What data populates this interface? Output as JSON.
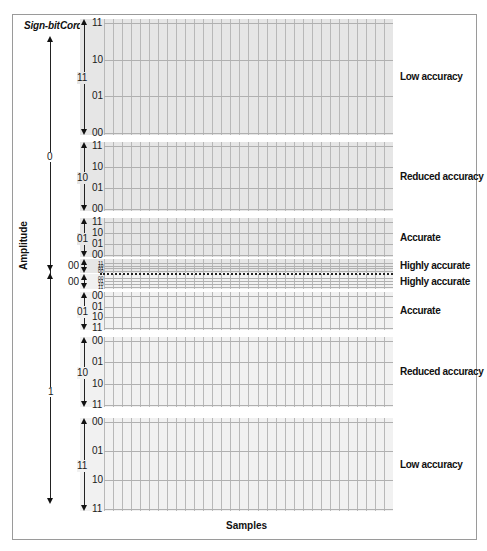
{
  "headers": {
    "sign_bit": "Sign-bit",
    "chord_bit": "Cord-bit",
    "step_bit": "Step-bit"
  },
  "axis": {
    "y_label": "Amplitude",
    "x_label": "Samples"
  },
  "sign_values": {
    "top": "0",
    "bottom": "1"
  },
  "sections": [
    {
      "chord": "11",
      "accuracy": "Low accuracy",
      "steps": [
        "11",
        "10",
        "01",
        "00"
      ],
      "top": 19,
      "bottom": 135,
      "shade": "dark"
    },
    {
      "chord": "10",
      "accuracy": "Reduced accuracy",
      "steps": [
        "11",
        "10",
        "01",
        "00"
      ],
      "top": 142,
      "bottom": 211,
      "shade": "dark"
    },
    {
      "chord": "01",
      "accuracy": "Accurate",
      "steps": [
        "11",
        "10",
        "01",
        "00"
      ],
      "top": 218,
      "bottom": 257,
      "shade": "dark"
    },
    {
      "chord": "00",
      "accuracy": "Highly accurate",
      "steps": [
        "11",
        "10",
        "01",
        "00"
      ],
      "top": 259,
      "bottom": 273,
      "shade": "dark"
    },
    {
      "chord": "00",
      "accuracy": "Highly accurate",
      "steps": [
        "00",
        "01",
        "10",
        "11"
      ],
      "top": 274,
      "bottom": 289,
      "shade": "light"
    },
    {
      "chord": "01",
      "accuracy": "Accurate",
      "steps": [
        "00",
        "01",
        "10",
        "11"
      ],
      "top": 292,
      "bottom": 330,
      "shade": "light"
    },
    {
      "chord": "10",
      "accuracy": "Reduced accuracy",
      "steps": [
        "00",
        "01",
        "10",
        "11"
      ],
      "top": 337,
      "bottom": 407,
      "shade": "light"
    },
    {
      "chord": "11",
      "accuracy": "Low accuracy",
      "steps": [
        "00",
        "01",
        "10",
        "11"
      ],
      "top": 418,
      "bottom": 511,
      "shade": "light"
    }
  ],
  "colors": {
    "grid_dark": "#e6e6e6",
    "grid_light": "#f1f1f1",
    "grid_line": "#b8b8b8",
    "ink": "#111111"
  }
}
